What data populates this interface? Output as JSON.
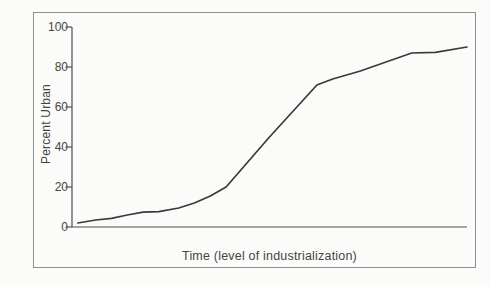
{
  "chart": {
    "y_label": "Percent Urban",
    "x_label": "Time (level of industrialization)",
    "frame_color": "#8d8d8d",
    "axis_color": "#4f4f4f",
    "curve_color": "#3a3a3a",
    "text_color": "#454545",
    "background_color": "#fbfbf9"
  },
  "chart_data": {
    "type": "line",
    "title": "",
    "xlabel": "Time (level of industrialization)",
    "ylabel": "Percent Urban",
    "xlim": [
      0,
      100
    ],
    "ylim": [
      0,
      100
    ],
    "y_ticks": [
      0,
      20,
      40,
      60,
      80,
      100
    ],
    "x_ticks": [],
    "grid": false,
    "legend_position": "none",
    "series": [
      {
        "name": "Percent Urban",
        "points": [
          [
            1.5,
            2
          ],
          [
            6,
            3.5
          ],
          [
            10,
            4.3
          ],
          [
            14,
            6
          ],
          [
            18,
            7.4
          ],
          [
            22,
            7.7
          ],
          [
            27,
            9.5
          ],
          [
            31,
            12
          ],
          [
            35,
            15.5
          ],
          [
            39,
            20
          ],
          [
            50,
            45
          ],
          [
            62,
            71
          ],
          [
            66,
            74
          ],
          [
            73,
            78
          ],
          [
            86,
            87
          ],
          [
            92,
            87.3
          ],
          [
            100,
            90
          ]
        ]
      }
    ]
  }
}
